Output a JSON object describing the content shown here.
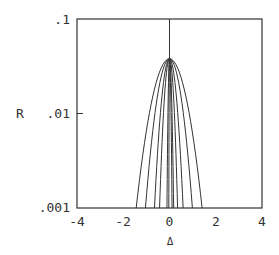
{
  "chart_data": {
    "type": "line",
    "title": "",
    "xlabel": "Δ",
    "ylabel": "R",
    "xlim": [
      -4,
      4
    ],
    "ylim": [
      0.001,
      0.1
    ],
    "yscale": "log",
    "grid": false,
    "legend": null,
    "x_ticks": [
      -4,
      -2,
      0,
      2,
      4
    ],
    "x_tick_labels": [
      "-4",
      "-2",
      "0",
      "2",
      "4"
    ],
    "y_ticks": [
      0.1,
      0.01,
      0.001
    ],
    "y_tick_labels": [
      ".1",
      ".01",
      ".001"
    ],
    "peak": {
      "x": 0,
      "y": 0.038
    },
    "center_line": {
      "x": 0,
      "from": 0.038,
      "to": 0.1
    },
    "series": [
      {
        "name": "curve-1",
        "half_width_left": 1.44,
        "half_width_right": 1.41,
        "at_R": 0.001
      },
      {
        "name": "curve-2",
        "half_width_left": 1.04,
        "half_width_right": 0.99,
        "at_R": 0.001
      },
      {
        "name": "curve-3",
        "half_width_left": 0.65,
        "half_width_right": 0.59,
        "at_R": 0.001
      },
      {
        "name": "curve-4",
        "half_width_left": 0.43,
        "half_width_right": 0.35,
        "at_R": 0.001
      },
      {
        "name": "curve-5",
        "half_width_left": 0.11,
        "half_width_right": 0.18,
        "at_R": 0.001
      },
      {
        "name": "curve-6",
        "half_width_left": 0.03,
        "half_width_right": 0.11,
        "at_R": 0.001
      }
    ]
  },
  "axes": {
    "x_label": "Δ",
    "y_label": "R",
    "x_tick_labels": [
      "-4",
      "-2",
      "0",
      "2",
      "4"
    ],
    "y_tick_labels": [
      ".1",
      ".01",
      ".001"
    ]
  }
}
